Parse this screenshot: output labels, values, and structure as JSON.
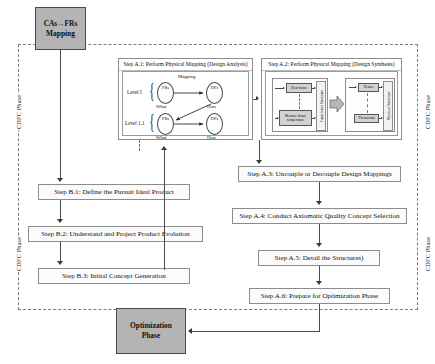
{
  "diagram": {
    "colors": {
      "grey_fill": "#b4b4b4",
      "box_border": "#8c8c8c",
      "dashed_border": "#7a7a7a",
      "line": "#4a4a4a",
      "mini_fill": "#d2d2d2"
    }
  },
  "phase_labels": {
    "left_top": "CDFC Phase",
    "left_bottom": "CDFC Phase",
    "right_top": "CDFC Phase",
    "right_bottom": "CDFC Phase"
  },
  "terminators": {
    "top": "CAs→FRs\nMapping",
    "top_line1": "CAs→FRs",
    "top_line2": "Mapping",
    "bottom_line1": "Optimization",
    "bottom_line2": "Phase"
  },
  "panel_a1": {
    "title": "Step A.1: Perform Physical Mapping (Design Analysis)",
    "levels": [
      {
        "label": "Level I"
      },
      {
        "label": "Level 1.1"
      }
    ],
    "mapping_label": "Mapping",
    "nodes": [
      {
        "id": "fr0",
        "label": "FRs"
      },
      {
        "id": "dp0",
        "label": "DPs"
      },
      {
        "id": "fr1",
        "label": "FRs"
      },
      {
        "id": "dp1",
        "label": "DPs"
      }
    ],
    "what_how": {
      "row1_what": "What",
      "row1_how": "How",
      "row2_what": "What",
      "row2_how": "How"
    }
  },
  "panel_a2": {
    "title": "Step A.2: Perform Physical Mapping (Design Synthesis)",
    "left_group": {
      "strip_label": "Functional Structure",
      "boxes": [
        {
          "label": "Heat house"
        },
        {
          "label": "Measure house temperature"
        }
      ]
    },
    "right_group": {
      "strip_label": "Physical Structure",
      "boxes": [
        {
          "label": "Heater"
        },
        {
          "label": "Thermostat"
        }
      ]
    }
  },
  "steps_left": [
    {
      "id": "b1",
      "label": "Step B.1: Define the Pursuit Ideal Product"
    },
    {
      "id": "b2",
      "label": "Step B.2: Understand and Project Product Evolution"
    },
    {
      "id": "b3",
      "label": "Step B.3: Initial Concept Generation"
    }
  ],
  "steps_right": [
    {
      "id": "a3",
      "label": "Step A.3: Uncouple or Decouple Design Mappings"
    },
    {
      "id": "a4",
      "label": "Step A.4: Conduct Axiomatic Quality Concept Selection"
    },
    {
      "id": "a5",
      "label": "Step A.5: Detail the Structures)"
    },
    {
      "id": "a6",
      "label": "Step A.6: Prepare for Optimization Phase"
    }
  ]
}
